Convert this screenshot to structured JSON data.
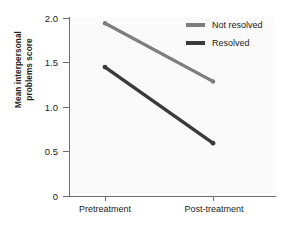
{
  "chart_data": {
    "type": "line",
    "title": "",
    "xlabel": "",
    "ylabel": "Mean interpersonal problems score",
    "ylabel_line1": "Mean interpersonal",
    "ylabel_line2": "problems score",
    "categories": [
      "Pretreatment",
      "Post-treatment"
    ],
    "yticks": [
      "0",
      "0.5",
      "1.0",
      "1.5",
      "2.0"
    ],
    "ytick_values": [
      0,
      0.5,
      1.0,
      1.5,
      2.0
    ],
    "ylim": [
      0,
      2.0
    ],
    "grid": false,
    "legend_position": "top-right",
    "series": [
      {
        "name": "Not resolved",
        "values": [
          1.93,
          1.28
        ],
        "color": "#7d7d7d"
      },
      {
        "name": "Resolved",
        "values": [
          1.44,
          0.59
        ],
        "color": "#3a3a3a"
      }
    ]
  }
}
